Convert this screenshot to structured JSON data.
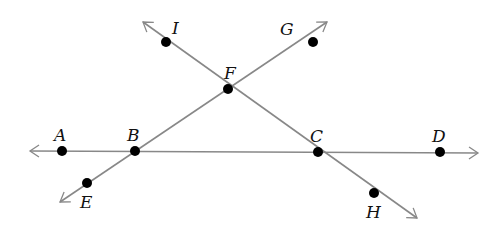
{
  "diagram": {
    "line_color": "#888888",
    "point_color": "#000000",
    "lines": [
      {
        "name": "line-AD",
        "from": [
          30,
          151
        ],
        "to": [
          478,
          153
        ]
      },
      {
        "name": "line-EG",
        "from": [
          60,
          202
        ],
        "to": [
          327,
          22
        ]
      },
      {
        "name": "line-IH",
        "from": [
          143,
          22
        ],
        "to": [
          417,
          218
        ]
      }
    ],
    "points": [
      {
        "label": "A",
        "x": 62,
        "y": 151,
        "lx": 54,
        "ly": 141
      },
      {
        "label": "B",
        "x": 135,
        "y": 151,
        "lx": 127,
        "ly": 141
      },
      {
        "label": "C",
        "x": 318,
        "y": 152,
        "lx": 310,
        "ly": 142
      },
      {
        "label": "D",
        "x": 440,
        "y": 152,
        "lx": 432,
        "ly": 142
      },
      {
        "label": "E",
        "x": 87,
        "y": 183,
        "lx": 80,
        "ly": 208
      },
      {
        "label": "F",
        "x": 228,
        "y": 89,
        "lx": 224,
        "ly": 79
      },
      {
        "label": "G",
        "x": 313,
        "y": 42,
        "lx": 280,
        "ly": 35
      },
      {
        "label": "I",
        "x": 166,
        "y": 42,
        "lx": 172,
        "ly": 34
      },
      {
        "label": "H",
        "x": 374,
        "y": 193,
        "lx": 366,
        "ly": 218
      }
    ]
  }
}
